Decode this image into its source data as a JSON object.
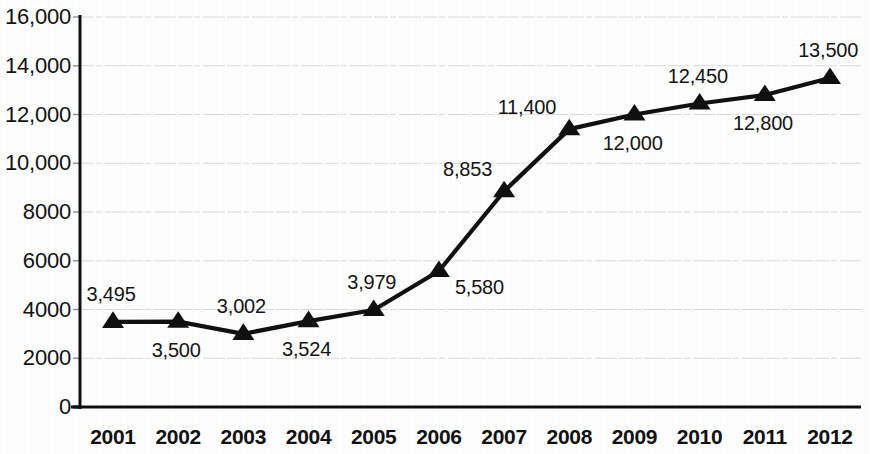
{
  "chart_data": {
    "type": "line",
    "title": "",
    "subtitle": "",
    "xlabel": "",
    "ylabel": "",
    "categories": [
      "2001",
      "2002",
      "2003",
      "2004",
      "2005",
      "2006",
      "2007",
      "2008",
      "2009",
      "2010",
      "2011",
      "2012"
    ],
    "values": [
      3495,
      3500,
      3002,
      3524,
      3979,
      5580,
      8853,
      11400,
      12000,
      12450,
      12800,
      13500
    ],
    "point_labels": [
      "3,495",
      "3,500",
      "3,002",
      "3,524",
      "3,979",
      "5,580",
      "8,853",
      "11,400",
      "12,000",
      "12,450",
      "12,800",
      "13,500"
    ],
    "point_label_positions": [
      "above",
      "below",
      "above",
      "below",
      "above",
      "below-right",
      "above-left",
      "above-left",
      "below",
      "above",
      "below",
      "above"
    ],
    "series": [
      {
        "name": "",
        "values": [
          3495,
          3500,
          3002,
          3524,
          3979,
          5580,
          8853,
          11400,
          12000,
          12450,
          12800,
          13500
        ]
      }
    ],
    "ylim": [
      0,
      16000
    ],
    "xlim_categories": 12,
    "y_ticks": [
      0,
      2000,
      4000,
      6000,
      8000,
      10000,
      12000,
      14000,
      16000
    ],
    "y_tick_labels": [
      "0",
      "2000",
      "4000",
      "6000",
      "8000",
      "10,000",
      "12,000",
      "14,000",
      "16,000"
    ],
    "grid": true,
    "grid_axis": "y",
    "legend": false,
    "legend_position": "none",
    "marker": "triangle",
    "line_color": "#101010",
    "marker_color": "#101010",
    "grid_color": "#d9d9d9",
    "axis_color": "#101010",
    "background_color": "#fefefe",
    "text_color": "#111111"
  },
  "axes": {
    "y_axis_name": "value-axis",
    "x_axis_name": "year-axis"
  }
}
